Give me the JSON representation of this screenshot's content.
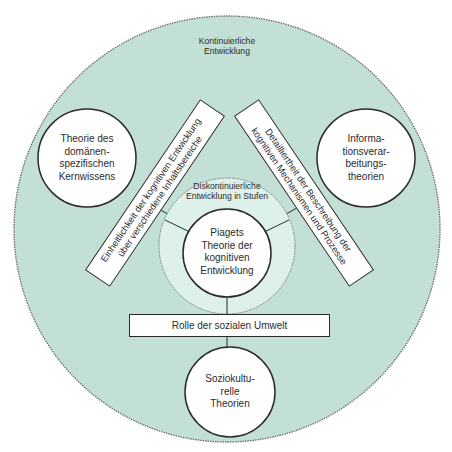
{
  "diagram": {
    "outer_region": {
      "label_line1": "Kontinuierliche",
      "label_line2": "Entwicklung",
      "fill": "#c2e0d6"
    },
    "inner_region": {
      "label_line1": "Diskontinuierliche",
      "label_line2": "Entwicklung in Stufen",
      "fill": "#def0ea"
    },
    "center_theory": {
      "lines": [
        "Piagets",
        "Theorie der",
        "kognitiven",
        "Entwicklung"
      ]
    },
    "theories": {
      "left": {
        "lines": [
          "Theorie des",
          "domänen-",
          "spezifischen",
          "Kernwissens"
        ]
      },
      "right": {
        "lines": [
          "Informa-",
          "tionsverar-",
          "beitungs-",
          "theorien"
        ]
      },
      "bottom": {
        "lines": [
          "Soziokultu-",
          "relle",
          "Theorien"
        ]
      }
    },
    "dimensions": {
      "left_bar": {
        "line1": "Einheitlichkeit der kognitiven Entwicklung",
        "line2": "über verschiedene Inhaltsbereiche"
      },
      "right_bar": {
        "line1": "Detailliertheit der Beschreibung der",
        "line2": "kognitiven Mechanismen und Prozesse"
      },
      "bottom_bar": {
        "line1": "Rolle der sozialen Umwelt"
      }
    },
    "colors": {
      "stroke": "#2a2a2a",
      "circle_fill": "#ffffff"
    }
  }
}
